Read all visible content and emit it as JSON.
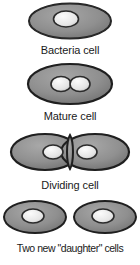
{
  "diagram": {
    "background_color": "#ffffff",
    "cell_fill_color": "#8f8f8f",
    "cell_outline_color": "#1f1f1f",
    "nucleoid_fill_color": "#ededed",
    "nucleoid_outline_color": "#2b2b2b",
    "text_color": "#1a1a1a",
    "stages": [
      {
        "id": "bacteria-cell",
        "label": "Bacteria cell",
        "cell_count": 1,
        "nucleoid_count": 1
      },
      {
        "id": "mature-cell",
        "label": "Mature cell",
        "cell_count": 1,
        "nucleoid_count": 2
      },
      {
        "id": "dividing-cell",
        "label": "Dividing cell",
        "cell_count": 1,
        "nucleoid_count": 2
      },
      {
        "id": "daughter-cells",
        "label": "Two new \"daughter\" cells",
        "cell_count": 2,
        "nucleoid_count": 2
      }
    ]
  }
}
